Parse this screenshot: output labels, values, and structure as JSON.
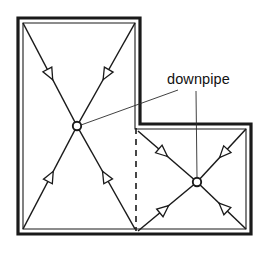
{
  "diagram": {
    "type": "roof-drainage-plan",
    "title": "downpipe",
    "canvas": {
      "width": 263,
      "height": 257,
      "background": "#ffffff"
    },
    "colors": {
      "outline": "#1a1a1a",
      "flow_line": "#1a1a1a",
      "arrow_fill": "#ffffff",
      "node_fill": "#ffffff",
      "leader": "#2b2b2b",
      "label": "#111111"
    },
    "label": {
      "text": "downpipe",
      "x": 167,
      "y": 84
    },
    "roof_outline": {
      "name": "l-shaped-roof-outline",
      "outer_points": "18,18 140,18 140,124 251,124 251,234 18,234",
      "inner_points": "23,23 135,23 135,129 246,129 246,229 23,229"
    },
    "zone_divider": {
      "name": "zone-divider-dashed",
      "x": 136,
      "y1": 128,
      "y2": 231
    },
    "downpipes": [
      {
        "name": "downpipe-node-left",
        "cx": 77,
        "cy": 126,
        "r": 4.2
      },
      {
        "name": "downpipe-node-right",
        "cx": 197,
        "cy": 182,
        "r": 4.2
      }
    ],
    "flow_lines": [
      {
        "name": "flow-left-top-left",
        "x1": 23,
        "y1": 23,
        "x2": 77,
        "y2": 126,
        "arrow_t": 0.55
      },
      {
        "name": "flow-left-top-right",
        "x1": 135,
        "y1": 23,
        "x2": 77,
        "y2": 126,
        "arrow_t": 0.55
      },
      {
        "name": "flow-left-bottom-left",
        "x1": 23,
        "y1": 229,
        "x2": 77,
        "y2": 126,
        "arrow_t": 0.56
      },
      {
        "name": "flow-left-bottom-right",
        "x1": 135,
        "y1": 229,
        "x2": 77,
        "y2": 126,
        "arrow_t": 0.56
      },
      {
        "name": "flow-right-top-left",
        "x1": 138,
        "y1": 131,
        "x2": 197,
        "y2": 182,
        "arrow_t": 0.5
      },
      {
        "name": "flow-right-top-right",
        "x1": 246,
        "y1": 129,
        "x2": 197,
        "y2": 182,
        "arrow_t": 0.54
      },
      {
        "name": "flow-right-bottom-left",
        "x1": 138,
        "y1": 231,
        "x2": 197,
        "y2": 182,
        "arrow_t": 0.52
      },
      {
        "name": "flow-right-bottom-right",
        "x1": 246,
        "y1": 229,
        "x2": 197,
        "y2": 182,
        "arrow_t": 0.55
      }
    ],
    "leader_lines": [
      {
        "name": "leader-to-left-node",
        "x1": 178,
        "y1": 90,
        "x2": 81,
        "y2": 125
      },
      {
        "name": "leader-to-right-node",
        "x1": 196,
        "y1": 91,
        "x2": 197,
        "y2": 178
      }
    ]
  }
}
